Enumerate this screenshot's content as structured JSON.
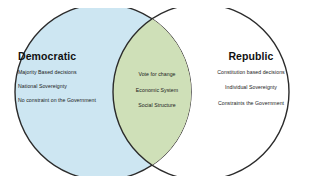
{
  "diagram": {
    "type": "venn",
    "background_color": "#ffffff",
    "stroke_color": "#2b2b2b",
    "left": {
      "title": "Democratic",
      "fill_color": "#cde6f2",
      "items": [
        "Majority Based decisions",
        "National Sovereignty",
        "No constraint on the Government"
      ]
    },
    "center": {
      "title": "",
      "fill_color": "#cfe0b8",
      "items": [
        "Vote for change",
        "Economic System",
        "Social Structure"
      ]
    },
    "right": {
      "title": "Republic",
      "fill_color": "#fbf8d5",
      "items": [
        "Constitution based decisions",
        "Individual Sovereignty",
        "Constraints the Government"
      ]
    }
  }
}
